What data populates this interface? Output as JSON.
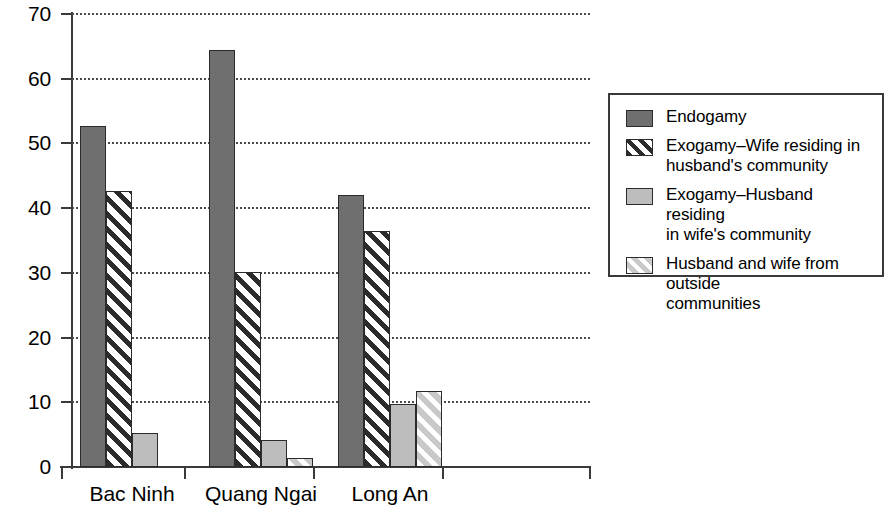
{
  "chart_data": {
    "type": "bar",
    "title": "",
    "subtitle": "",
    "xlabel": "",
    "ylabel": "",
    "ylim": [
      0,
      70
    ],
    "ytick_labels": [
      "0",
      "10",
      "20",
      "30",
      "40",
      "50",
      "60",
      "70"
    ],
    "ytick_values": [
      0,
      10,
      20,
      30,
      40,
      50,
      60,
      70
    ],
    "grid": true,
    "grid_style": "dotted horizontal",
    "legend_position": "right",
    "categories": [
      "Bac Ninh",
      "Quang Ngai",
      "Long An"
    ],
    "series": [
      {
        "name": "Endogamy",
        "pattern": "solid-dark-gray",
        "color": "#6f6f6f",
        "values": [
          52.7,
          64.4,
          42.1
        ]
      },
      {
        "name": "Exogamy–Wife residing in\nhusband's community",
        "pattern": "dark-diagonal-hatch",
        "color": "#2b2b2b",
        "values": [
          42.6,
          30.1,
          36.5
        ]
      },
      {
        "name": "Exogamy–Husband residing\nin wife's community",
        "pattern": "solid-light-gray",
        "color": "#bdbdbd",
        "values": [
          5.3,
          4.1,
          9.7
        ]
      },
      {
        "name": "Husband and wife from outside\ncommunities",
        "pattern": "light-diagonal-hatch",
        "color": "#c9c9c9",
        "values": [
          0,
          1.4,
          11.8
        ]
      }
    ]
  },
  "legend": {
    "items": [
      {
        "label": "Endogamy"
      },
      {
        "label": "Exogamy–Wife residing in\nhusband's community"
      },
      {
        "label": "Exogamy–Husband residing\nin wife's community"
      },
      {
        "label": "Husband and wife from outside\ncommunities"
      }
    ]
  }
}
